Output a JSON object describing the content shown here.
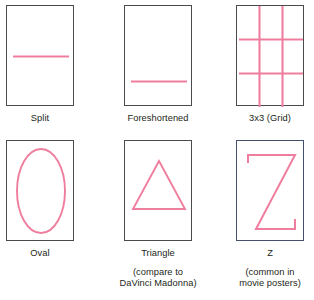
{
  "page": {
    "background": "#ffffff",
    "stroke_pink": "#ef7e9e",
    "frame_border": "#4b4b4d",
    "frame_border_alt": "#45506a",
    "text_color": "#231f20"
  },
  "panels": [
    {
      "id": "split",
      "shape": "horizontal-line-centered",
      "label": "Split",
      "note": "",
      "frame_style": "default"
    },
    {
      "id": "foreshortened",
      "shape": "horizontal-line-low",
      "label": "Foreshortened",
      "note": "",
      "frame_style": "default"
    },
    {
      "id": "grid-3x3",
      "shape": "rule-of-thirds-grid",
      "label": "3x3 (Grid)",
      "note": "",
      "frame_style": "default"
    },
    {
      "id": "oval",
      "shape": "ellipse",
      "label": "Oval",
      "note": "",
      "frame_style": "default"
    },
    {
      "id": "triangle",
      "shape": "triangle",
      "label": "Triangle",
      "note": "(compare to\nDaVinci Madonna)",
      "frame_style": "default"
    },
    {
      "id": "z",
      "shape": "letter-z",
      "label": "Z",
      "note": "(common in\nmovie posters)",
      "frame_style": "blueish"
    }
  ]
}
